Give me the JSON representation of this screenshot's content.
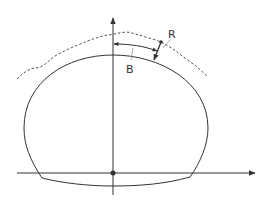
{
  "diagram": {
    "type": "tunnel-cross-section",
    "labels": {
      "B": "B",
      "R": "R"
    },
    "colors": {
      "line": "#333333",
      "dashed": "#555555",
      "background": "#ffffff"
    },
    "elements": [
      {
        "id": "tunnel-profile",
        "description": "horseshoe tunnel outline with curved invert"
      },
      {
        "id": "vertical-axis",
        "description": "vertical axis with arrowhead at top"
      },
      {
        "id": "horizontal-axis",
        "description": "horizontal axis with arrowhead at right"
      },
      {
        "id": "origin-point",
        "description": "filled dot at axes intersection"
      },
      {
        "id": "ground-surface",
        "description": "dashed irregular line above the crown"
      },
      {
        "id": "dimension-B",
        "description": "double-headed arc arrow along crown, labeled B"
      },
      {
        "id": "dimension-R",
        "description": "short radial arrow between crown and dashed line, labeled R"
      }
    ]
  }
}
